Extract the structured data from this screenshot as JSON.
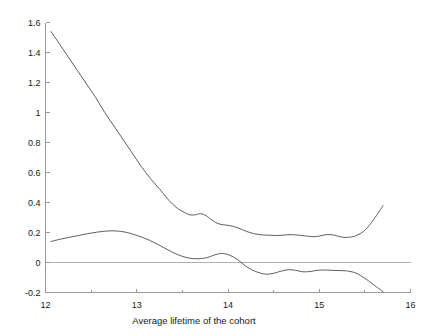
{
  "chart_data": {
    "type": "line",
    "title": "",
    "subtitle": "",
    "xlabel": "Average lifetime of the cohort",
    "ylabel": "",
    "xlim": [
      12,
      16
    ],
    "ylim": [
      -0.2,
      1.6
    ],
    "grid": false,
    "legend": null,
    "xticks": [
      12,
      13,
      14,
      15,
      16
    ],
    "xtick_labels": [
      "12",
      "13",
      "14",
      "15",
      "16"
    ],
    "xminorticks": [
      12.5,
      13.5,
      14.5,
      15.5
    ],
    "yticks": [
      -0.2,
      0,
      0.2,
      0.4,
      0.6,
      0.8,
      1.0,
      1.2,
      1.4,
      1.6
    ],
    "ytick_labels": [
      "-0.2",
      "0",
      "0.2",
      "0.4",
      "0.6",
      "0.8",
      "1",
      "1.2",
      "1.4",
      "1.6"
    ],
    "annotations": [
      {
        "name": "zero-reference-line",
        "type": "hline",
        "y": 0,
        "color": "#b0b0b0"
      }
    ],
    "colors": {
      "axis": "#9a9a9a",
      "upper_curve": "#4d4d4d",
      "lower_curve": "#4d4d4d",
      "zero_line": "#b5b5b5",
      "text": "#1a1a1a",
      "background": "#ffffff"
    },
    "series": [
      {
        "name": "upper-curve",
        "x": [
          12.06,
          12.15,
          12.25,
          12.35,
          12.45,
          12.55,
          12.65,
          12.75,
          12.85,
          12.95,
          13.05,
          13.15,
          13.25,
          13.33,
          13.4,
          13.46,
          13.52,
          13.58,
          13.64,
          13.7,
          13.76,
          13.82,
          13.88,
          13.94,
          14.0,
          14.06,
          14.12,
          14.2,
          14.28,
          14.36,
          14.44,
          14.52,
          14.6,
          14.68,
          14.76,
          14.84,
          14.92,
          15.0,
          15.08,
          15.16,
          15.24,
          15.32,
          15.4,
          15.5,
          15.6,
          15.7
        ],
        "y": [
          1.54,
          1.46,
          1.37,
          1.28,
          1.19,
          1.1,
          1.0,
          0.91,
          0.82,
          0.73,
          0.64,
          0.56,
          0.49,
          0.43,
          0.385,
          0.355,
          0.335,
          0.318,
          0.318,
          0.325,
          0.312,
          0.285,
          0.262,
          0.252,
          0.248,
          0.24,
          0.228,
          0.208,
          0.193,
          0.185,
          0.182,
          0.18,
          0.182,
          0.186,
          0.183,
          0.178,
          0.172,
          0.176,
          0.186,
          0.183,
          0.17,
          0.168,
          0.178,
          0.215,
          0.29,
          0.38
        ]
      },
      {
        "name": "lower-curve",
        "x": [
          12.06,
          12.16,
          12.26,
          12.36,
          12.46,
          12.56,
          12.66,
          12.74,
          12.82,
          12.9,
          12.98,
          13.06,
          13.14,
          13.22,
          13.3,
          13.38,
          13.46,
          13.54,
          13.62,
          13.7,
          13.78,
          13.86,
          13.94,
          14.02,
          14.1,
          14.18,
          14.26,
          14.34,
          14.42,
          14.5,
          14.58,
          14.66,
          14.74,
          14.82,
          14.9,
          14.98,
          15.06,
          15.14,
          15.22,
          15.3,
          15.4,
          15.5,
          15.6,
          15.7
        ],
        "y": [
          0.14,
          0.155,
          0.168,
          0.18,
          0.192,
          0.202,
          0.209,
          0.211,
          0.208,
          0.199,
          0.185,
          0.168,
          0.148,
          0.124,
          0.098,
          0.072,
          0.05,
          0.034,
          0.026,
          0.026,
          0.034,
          0.052,
          0.06,
          0.048,
          0.022,
          -0.018,
          -0.048,
          -0.068,
          -0.078,
          -0.072,
          -0.058,
          -0.048,
          -0.052,
          -0.062,
          -0.06,
          -0.052,
          -0.05,
          -0.052,
          -0.054,
          -0.056,
          -0.07,
          -0.105,
          -0.15,
          -0.195
        ]
      }
    ]
  },
  "axes": {
    "x_axis_name": "x-axis",
    "y_axis_name": "y-axis"
  }
}
